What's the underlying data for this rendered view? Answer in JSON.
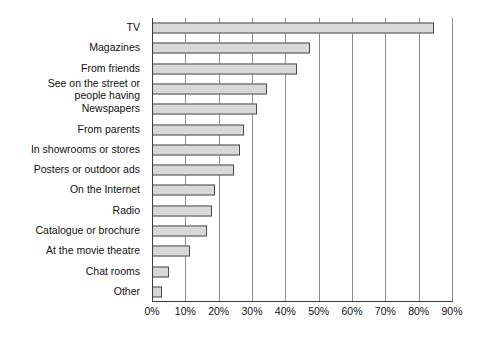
{
  "chart_data": {
    "type": "bar",
    "orientation": "horizontal",
    "title": "",
    "subtitle": "",
    "xlabel": "",
    "ylabel": "",
    "xlim": [
      0,
      90
    ],
    "grid": true,
    "legend": false,
    "categories": [
      "TV",
      "Magazines",
      "From friends",
      "See on the street or\npeople having",
      "Newspapers",
      "From parents",
      "In showrooms or stores",
      "Posters or outdoor ads",
      "On the Internet",
      "Radio",
      "Catalogue or brochure",
      "At the movie theatre",
      "Chat rooms",
      "Other"
    ],
    "values": [
      84.5,
      47.5,
      43.5,
      34.5,
      31.5,
      27.5,
      26.5,
      24.5,
      19.0,
      18.0,
      16.5,
      11.5,
      5.0,
      3.0
    ],
    "value_suffix": "%",
    "tick_labels": [
      "0%",
      "10%",
      "20%",
      "30%",
      "40%",
      "50%",
      "60%",
      "70%",
      "80%",
      "90%"
    ],
    "tick_values": [
      0,
      10,
      20,
      30,
      40,
      50,
      60,
      70,
      80,
      90
    ],
    "colors": {
      "bar_fill": "#d8d8d8",
      "bar_border": "#4a4a4a",
      "gridline": "#8e8e8e",
      "axis": "#3a3a3a",
      "text": "#111111",
      "background": "#ffffff"
    }
  }
}
